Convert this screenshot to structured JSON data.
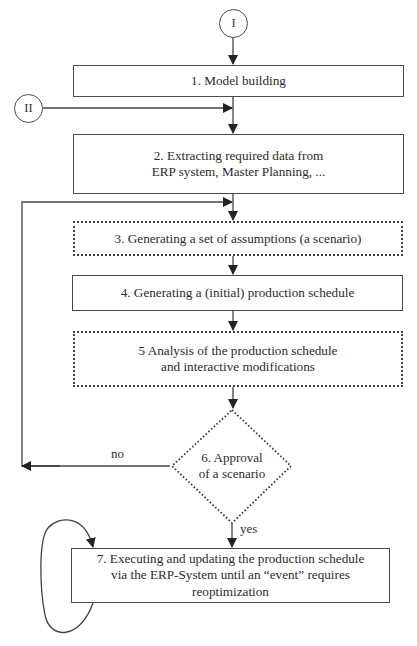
{
  "diagram": {
    "type": "flowchart",
    "connectors": [
      {
        "id": "I",
        "label": "I"
      },
      {
        "id": "II",
        "label": "II"
      }
    ],
    "steps": [
      {
        "id": 1,
        "label": "1. Model building",
        "style": "solid"
      },
      {
        "id": 2,
        "line1": "2. Extracting required data from",
        "line2": "ERP system, Master Planning, ...",
        "style": "solid"
      },
      {
        "id": 3,
        "label": "3. Generating a set of assumptions (a scenario)",
        "style": "dotted"
      },
      {
        "id": 4,
        "label": "4. Generating a (initial) production schedule",
        "style": "solid"
      },
      {
        "id": 5,
        "line1": "5 Analysis of the production schedule",
        "line2": "and interactive modifications",
        "style": "dotted"
      },
      {
        "id": 6,
        "line1": "6. Approval",
        "line2": "of a scenario",
        "shape": "diamond",
        "style": "dotted"
      },
      {
        "id": 7,
        "line1": "7. Executing and updating the production schedule",
        "line2": "via the ERP-System until an “event” requires",
        "line3": "reoptimization",
        "style": "solid"
      }
    ],
    "edge_labels": {
      "no": "no",
      "yes": "yes"
    },
    "edges": [
      {
        "from": "I",
        "to": 1
      },
      {
        "from": 1,
        "to": 2
      },
      {
        "from": "II",
        "to": "edge 1-2"
      },
      {
        "from": 2,
        "to": 3
      },
      {
        "from": 3,
        "to": 4
      },
      {
        "from": 4,
        "to": 5
      },
      {
        "from": 5,
        "to": 6
      },
      {
        "from": 6,
        "to": 3,
        "label": "no"
      },
      {
        "from": 6,
        "to": 7,
        "label": "yes"
      },
      {
        "from": 7,
        "to": 7,
        "type": "self-loop"
      }
    ]
  }
}
